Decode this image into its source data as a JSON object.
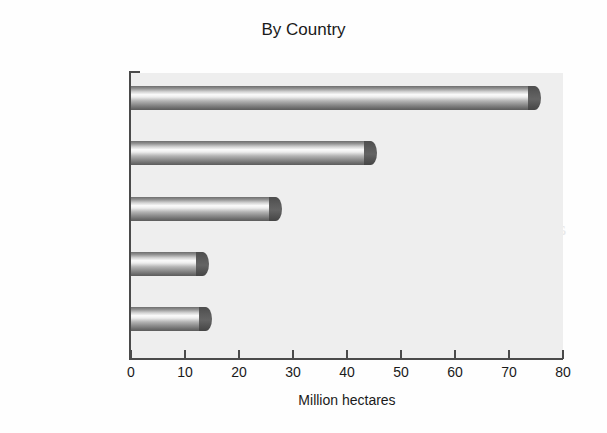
{
  "chart_data": {
    "type": "bar",
    "orientation": "horizontal",
    "title": "By Country",
    "xlabel": "Million hectares",
    "ylabel": "",
    "categories": [
      "United states",
      "Brazil",
      "Argentina",
      "India",
      "Canada"
    ],
    "values": [
      76,
      45.5,
      28,
      14.5,
      15
    ],
    "xlim": [
      0,
      80
    ],
    "xticks": [
      0,
      10,
      20,
      30,
      40,
      50,
      60,
      70,
      80
    ],
    "xtick_labels": [
      "0",
      "10",
      "20",
      "30",
      "40",
      "50",
      "60",
      "70",
      "80"
    ],
    "grid": false,
    "legend": false,
    "bar_style": "3d-cylinder",
    "colors": {
      "plot_background": "#eeeeee",
      "page_background": "#fefefe",
      "axis": "#4a4a4a",
      "bar_body_highlight": "#fbfbfb",
      "bar_body_shadow": "#5c5c5c",
      "bar_cap": "#545454",
      "text": "#1a1a1a"
    }
  },
  "scan_artifacts": {
    "bleed_lines": [
      "asic, naturally",
      "applications, w",
      "o strength and porosity",
      "ants of fib bres been coated, and sc",
      "rials has been combined. For the",
      "s has created for the  fo und struct",
      "shape required for some specific p"
    ]
  }
}
